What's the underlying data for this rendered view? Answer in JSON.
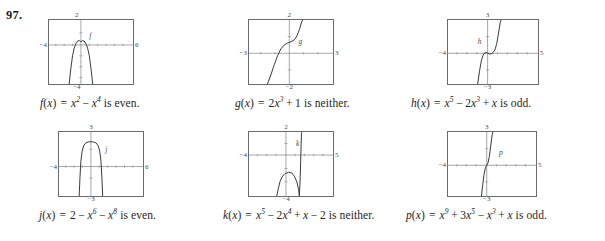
{
  "exercise": {
    "number": "97."
  },
  "graphs": [
    {
      "id": "f",
      "curve_label": "f",
      "axis": {
        "top": "2",
        "bottom": "−4",
        "left": "−4",
        "right": "6"
      },
      "window": {
        "xmin": -4,
        "xmax": 6,
        "ymin": -4,
        "ymax": 2
      },
      "caption": {
        "name": "f",
        "text": "f(x) = x² − x⁴ is even.",
        "parts": [
          {
            "t": "f",
            "s": "fn"
          },
          {
            "t": "(",
            "s": "p"
          },
          {
            "t": "x",
            "s": "var"
          },
          {
            "t": ")",
            "s": "p"
          },
          {
            "t": "=",
            "s": "eq"
          },
          {
            "t": "x",
            "s": "var"
          },
          {
            "t": "2",
            "s": "sup"
          },
          {
            "t": "−",
            "s": "op"
          },
          {
            "t": "x",
            "s": "var"
          },
          {
            "t": "4",
            "s": "sup"
          },
          {
            "t": " is even.",
            "s": "txt"
          }
        ]
      }
    },
    {
      "id": "g",
      "curve_label": "g",
      "axis": {
        "top": "2",
        "bottom": "−2",
        "left": "−3",
        "right": "3"
      },
      "window": {
        "xmin": -3,
        "xmax": 3,
        "ymin": -2,
        "ymax": 2
      },
      "caption": {
        "name": "g",
        "text": "g(x) = 2x³ + 1 is neither.",
        "parts": [
          {
            "t": "g",
            "s": "fn"
          },
          {
            "t": "(",
            "s": "p"
          },
          {
            "t": "x",
            "s": "var"
          },
          {
            "t": ")",
            "s": "p"
          },
          {
            "t": "=",
            "s": "eq"
          },
          {
            "t": "2",
            "s": "num"
          },
          {
            "t": "x",
            "s": "var"
          },
          {
            "t": "3",
            "s": "sup"
          },
          {
            "t": "+",
            "s": "op"
          },
          {
            "t": "1",
            "s": "num"
          },
          {
            "t": " is neither.",
            "s": "txt"
          }
        ]
      }
    },
    {
      "id": "h",
      "curve_label": "h",
      "axis": {
        "top": "3",
        "bottom": "−3",
        "left": "−4",
        "right": "5"
      },
      "window": {
        "xmin": -4,
        "xmax": 5,
        "ymin": -3,
        "ymax": 3
      },
      "caption": {
        "name": "h",
        "text": "h(x) = x⁵ − 2x³ + x is odd.",
        "parts": [
          {
            "t": "h",
            "s": "fn"
          },
          {
            "t": "(",
            "s": "p"
          },
          {
            "t": "x",
            "s": "var"
          },
          {
            "t": ")",
            "s": "p"
          },
          {
            "t": "=",
            "s": "eq"
          },
          {
            "t": "x",
            "s": "var"
          },
          {
            "t": "5",
            "s": "sup"
          },
          {
            "t": "−",
            "s": "op"
          },
          {
            "t": "2",
            "s": "num"
          },
          {
            "t": "x",
            "s": "var"
          },
          {
            "t": "3",
            "s": "sup"
          },
          {
            "t": "+",
            "s": "op"
          },
          {
            "t": "x",
            "s": "var"
          },
          {
            "t": " is odd.",
            "s": "txt"
          }
        ]
      }
    },
    {
      "id": "j",
      "curve_label": "j",
      "axis": {
        "top": "3",
        "bottom": "−3",
        "left": "−4",
        "right": "6"
      },
      "window": {
        "xmin": -4,
        "xmax": 6,
        "ymin": -3,
        "ymax": 3
      },
      "caption": {
        "name": "j",
        "text": "j(x) = 2 − x⁶ − x⁸ is even.",
        "parts": [
          {
            "t": "j",
            "s": "fn"
          },
          {
            "t": "(",
            "s": "p"
          },
          {
            "t": "x",
            "s": "var"
          },
          {
            "t": ")",
            "s": "p"
          },
          {
            "t": "=",
            "s": "eq"
          },
          {
            "t": "2",
            "s": "num"
          },
          {
            "t": "−",
            "s": "op"
          },
          {
            "t": "x",
            "s": "var"
          },
          {
            "t": "6",
            "s": "sup"
          },
          {
            "t": "−",
            "s": "op"
          },
          {
            "t": "x",
            "s": "var"
          },
          {
            "t": "8",
            "s": "sup"
          },
          {
            "t": " is even.",
            "s": "txt"
          }
        ]
      }
    },
    {
      "id": "k",
      "curve_label": "k",
      "axis": {
        "top": "2",
        "bottom": "−4",
        "left": "−4",
        "right": "5"
      },
      "window": {
        "xmin": -4,
        "xmax": 5,
        "ymin": -4,
        "ymax": 2
      },
      "caption": {
        "name": "k",
        "text": "k(x) = x⁵ − 2x⁴ + x − 2 is neither.",
        "parts": [
          {
            "t": "k",
            "s": "fn"
          },
          {
            "t": "(",
            "s": "p"
          },
          {
            "t": "x",
            "s": "var"
          },
          {
            "t": ")",
            "s": "p"
          },
          {
            "t": "=",
            "s": "eq"
          },
          {
            "t": "x",
            "s": "var"
          },
          {
            "t": "5",
            "s": "sup"
          },
          {
            "t": "−",
            "s": "op"
          },
          {
            "t": "2",
            "s": "num"
          },
          {
            "t": "x",
            "s": "var"
          },
          {
            "t": "4",
            "s": "sup"
          },
          {
            "t": "+",
            "s": "op"
          },
          {
            "t": "x",
            "s": "var"
          },
          {
            "t": "−",
            "s": "op"
          },
          {
            "t": "2",
            "s": "num"
          },
          {
            "t": " is neither.",
            "s": "txt"
          }
        ]
      }
    },
    {
      "id": "p",
      "curve_label": "p",
      "axis": {
        "top": "3",
        "bottom": "−3",
        "left": "−4",
        "right": "5"
      },
      "window": {
        "xmin": -4,
        "xmax": 5,
        "ymin": -3,
        "ymax": 3
      },
      "caption": {
        "name": "p",
        "text": "p(x) = x⁹ + 3x⁵ − x³ + x is odd.",
        "parts": [
          {
            "t": "p",
            "s": "fn"
          },
          {
            "t": "(",
            "s": "p"
          },
          {
            "t": "x",
            "s": "var"
          },
          {
            "t": ")",
            "s": "p"
          },
          {
            "t": "=",
            "s": "eq"
          },
          {
            "t": "x",
            "s": "var"
          },
          {
            "t": "9",
            "s": "sup"
          },
          {
            "t": "+",
            "s": "op"
          },
          {
            "t": "3",
            "s": "num"
          },
          {
            "t": "x",
            "s": "var"
          },
          {
            "t": "5",
            "s": "sup"
          },
          {
            "t": "−",
            "s": "op"
          },
          {
            "t": "x",
            "s": "var"
          },
          {
            "t": "3",
            "s": "sup"
          },
          {
            "t": "+",
            "s": "op"
          },
          {
            "t": "x",
            "s": "var"
          },
          {
            "t": " is odd.",
            "s": "txt"
          }
        ]
      }
    }
  ],
  "colors": {
    "ink": "#2b2b2b",
    "frame": "#6b6b74",
    "axis": "#55555d",
    "curve": "#3a3a42",
    "page": "#ffffff"
  }
}
